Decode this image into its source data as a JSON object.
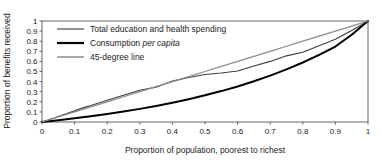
{
  "chart_data": {
    "type": "line",
    "title": "",
    "subtitle": "",
    "xlabel": "Proportion of population, poorest to richest",
    "ylabel": "Proportion of benefits received",
    "xlim": [
      0,
      1
    ],
    "ylim": [
      0,
      1
    ],
    "grid": false,
    "legend_position": "top-left",
    "xticks": [
      "0",
      "0.1",
      "0.2",
      "0.3",
      "0.4",
      "0.5",
      "0.6",
      "0.7",
      "0.8",
      "0.9",
      "1"
    ],
    "yticks": [
      "0",
      "0.1",
      "0.2",
      "0.3",
      "0.4",
      "0.5",
      "0.6",
      "0.7",
      "0.8",
      "0.9",
      "1"
    ],
    "x": [
      0,
      0.05,
      0.1,
      0.13,
      0.15,
      0.2,
      0.25,
      0.3,
      0.35,
      0.4,
      0.45,
      0.5,
      0.55,
      0.6,
      0.65,
      0.7,
      0.75,
      0.8,
      0.85,
      0.9,
      0.95,
      1
    ],
    "series": [
      {
        "name": "Total education and health spending",
        "color": "#3c3c3c",
        "width": 1.1,
        "values": [
          0,
          0.055,
          0.11,
          0.145,
          0.163,
          0.215,
          0.265,
          0.315,
          0.345,
          0.405,
          0.44,
          0.47,
          0.485,
          0.505,
          0.555,
          0.6,
          0.655,
          0.69,
          0.755,
          0.82,
          0.905,
          1
        ]
      },
      {
        "name": "Consumption per capita",
        "color": "#000000",
        "width": 2.0,
        "values": [
          0,
          0.018,
          0.037,
          0.049,
          0.057,
          0.079,
          0.103,
          0.13,
          0.159,
          0.191,
          0.226,
          0.264,
          0.306,
          0.352,
          0.403,
          0.459,
          0.521,
          0.589,
          0.664,
          0.747,
          0.864,
          1
        ]
      },
      {
        "name": "45-degree line",
        "color": "#8c8c8c",
        "width": 1.3,
        "values": [
          0,
          0.05,
          0.1,
          0.13,
          0.15,
          0.2,
          0.25,
          0.3,
          0.35,
          0.4,
          0.45,
          0.5,
          0.55,
          0.6,
          0.65,
          0.7,
          0.75,
          0.8,
          0.85,
          0.9,
          0.95,
          1
        ]
      }
    ],
    "legend": [
      {
        "label_prefix": "Total education and health spending",
        "label_italic": "",
        "label_suffix": ""
      },
      {
        "label_prefix": "Consumption ",
        "label_italic": "per capita",
        "label_suffix": ""
      },
      {
        "label_prefix": "45-degree line",
        "label_italic": "",
        "label_suffix": ""
      }
    ]
  },
  "axes": {
    "x_title": "Proportion of population, poorest to richest",
    "y_title": "Proportion of benefits received",
    "x_ticks": [
      "0",
      "0.1",
      "0.2",
      "0.3",
      "0.4",
      "0.5",
      "0.6",
      "0.7",
      "0.8",
      "0.9",
      "1"
    ],
    "y_ticks": [
      "1",
      "0.9",
      "0.8",
      "0.7",
      "0.6",
      "0.5",
      "0.4",
      "0.3",
      "0.2",
      "0.1",
      "0"
    ]
  },
  "legend": {
    "entry0_text": "Total education and health spending",
    "entry1_prefix": "Consumption ",
    "entry1_italic": "per capita",
    "entry2_text": "45-degree line"
  }
}
